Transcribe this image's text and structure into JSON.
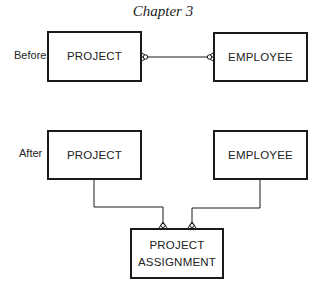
{
  "title": "Chapter 3",
  "diagram": {
    "type": "entity-relationship",
    "notation": "crow's foot",
    "before": {
      "label": "Before",
      "entities": [
        {
          "id": "project",
          "name": "PROJECT"
        },
        {
          "id": "employee",
          "name": "EMPLOYEE"
        }
      ],
      "relationships": [
        {
          "from": "project",
          "to": "employee",
          "cardinality": "many-to-many"
        }
      ]
    },
    "after": {
      "label": "After",
      "entities": [
        {
          "id": "project",
          "name": "PROJECT"
        },
        {
          "id": "employee",
          "name": "EMPLOYEE"
        },
        {
          "id": "project_assignment",
          "name_line1": "PROJECT",
          "name_line2": "ASSIGNMENT"
        }
      ],
      "relationships": [
        {
          "from": "project",
          "to": "project_assignment",
          "cardinality": "one-to-many"
        },
        {
          "from": "employee",
          "to": "project_assignment",
          "cardinality": "one-to-many"
        }
      ]
    }
  },
  "colors": {
    "line": "#1a1a1a",
    "background": "#ffffff"
  }
}
